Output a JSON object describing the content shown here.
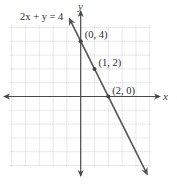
{
  "chart_data": {
    "type": "line",
    "title": "",
    "equation_label": "2x + y = 4",
    "xlabel": "x",
    "ylabel": "y",
    "xlim": [
      -5,
      5
    ],
    "ylim": [
      -5,
      5
    ],
    "grid": true,
    "grid_step": 1,
    "series": [
      {
        "name": "2x + y = 4",
        "line_x_range": [
          -0.8,
          4.8
        ],
        "slope": -2,
        "intercept": 4,
        "points": [
          {
            "x": 0,
            "y": 4,
            "label": "(0, 4)"
          },
          {
            "x": 1,
            "y": 2,
            "label": "(1, 2)"
          },
          {
            "x": 2,
            "y": 0,
            "label": "(2, 0)"
          }
        ]
      }
    ],
    "colors": {
      "line": "#555555",
      "axis": "#4a4a4a",
      "grid": "#c8c8c8"
    }
  }
}
